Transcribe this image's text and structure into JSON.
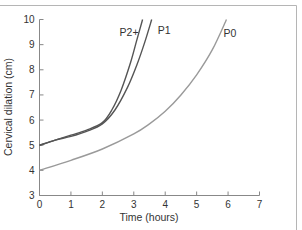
{
  "chart_data": {
    "type": "line",
    "title": "",
    "xlabel": "Time (hours)",
    "ylabel": "Cervical dilation (cm)",
    "xlim": [
      0,
      7
    ],
    "ylim": [
      3,
      10
    ],
    "xticks": [
      0,
      1,
      2,
      3,
      4,
      5,
      6,
      7
    ],
    "yticks": [
      3,
      4,
      5,
      6,
      7,
      8,
      9,
      10
    ],
    "grid": false,
    "legend": "inline labels at curve ends",
    "series": [
      {
        "name": "P2+",
        "color": "#555555",
        "x": [
          0,
          0.5,
          1.0,
          1.5,
          2.0,
          2.3,
          2.6,
          2.9,
          3.1,
          3.28
        ],
        "y": [
          5.0,
          5.2,
          5.4,
          5.6,
          5.9,
          6.4,
          7.2,
          8.3,
          9.2,
          10.0
        ]
      },
      {
        "name": "P1",
        "color": "#555555",
        "x": [
          0,
          0.5,
          1.0,
          1.5,
          2.0,
          2.4,
          2.8,
          3.1,
          3.35,
          3.57
        ],
        "y": [
          5.0,
          5.2,
          5.35,
          5.55,
          5.85,
          6.4,
          7.3,
          8.2,
          9.1,
          10.0
        ]
      },
      {
        "name": "P0",
        "color": "#9a9a9a",
        "x": [
          0,
          1,
          2,
          3,
          3.5,
          4,
          4.5,
          5,
          5.5,
          5.95
        ],
        "y": [
          4.0,
          4.4,
          4.85,
          5.45,
          5.85,
          6.35,
          7.0,
          7.8,
          8.8,
          10.0
        ]
      }
    ]
  }
}
